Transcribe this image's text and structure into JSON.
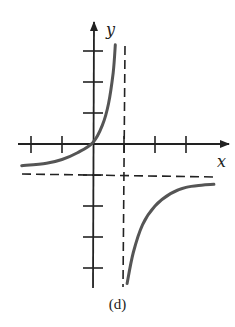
{
  "caption": "(d)",
  "colors": {
    "axis": "#222222",
    "curve": "#555555",
    "asymptote": "#222222",
    "background": "#ffffff"
  },
  "chart_data": {
    "type": "line",
    "title": "",
    "caption": "(d)",
    "xlabel": "x",
    "ylabel": "y",
    "xlim": [
      -2.3,
      4.3
    ],
    "ylim": [
      -4.5,
      3.8
    ],
    "grid": false,
    "legend": null,
    "x_ticks": [
      -2,
      -1,
      1,
      2,
      3
    ],
    "y_ticks": [
      -4,
      -3,
      -2,
      -1,
      1,
      2,
      3
    ],
    "tick_labels_shown": false,
    "asymptotes": {
      "vertical": [
        {
          "x": 1,
          "style": "dashed"
        }
      ],
      "horizontal": [
        {
          "y": -1,
          "style": "dashed"
        }
      ]
    },
    "series": [
      {
        "name": "left branch",
        "points": [
          [
            -2.3,
            -0.7
          ],
          [
            -1.5,
            -0.62
          ],
          [
            -1,
            -0.5
          ],
          [
            -0.5,
            -0.28
          ],
          [
            0,
            0.05
          ],
          [
            0.3,
            0.6
          ],
          [
            0.5,
            1.3
          ],
          [
            0.65,
            2.3
          ],
          [
            0.72,
            3.2
          ]
        ]
      },
      {
        "name": "right branch",
        "points": [
          [
            1.1,
            -4.5
          ],
          [
            1.3,
            -3.5
          ],
          [
            1.6,
            -2.6
          ],
          [
            2,
            -2.0
          ],
          [
            2.5,
            -1.6
          ],
          [
            3,
            -1.4
          ],
          [
            3.5,
            -1.33
          ],
          [
            3.9,
            -1.3
          ]
        ]
      }
    ]
  }
}
